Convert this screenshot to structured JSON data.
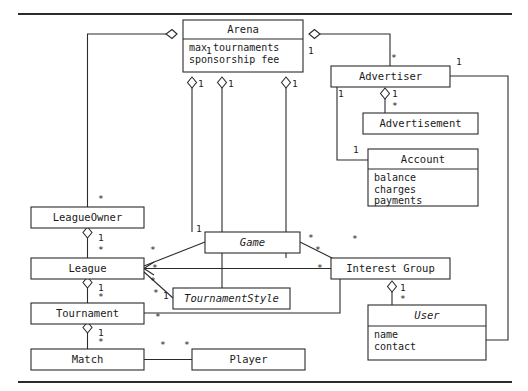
{
  "diagram": {
    "type": "uml-class-diagram",
    "frame": {
      "top_rule_y": 14,
      "bottom_rule_y": 382,
      "rule_color": "#2b2b2b"
    },
    "classes": [
      {
        "id": "arena",
        "name": "Arena",
        "abstract": false,
        "attributes": [
          "max tournaments",
          "sponsorship fee"
        ],
        "x": 183,
        "y": 20,
        "w": 120,
        "h": 52,
        "header_h": 19
      },
      {
        "id": "advertiser",
        "name": "Advertiser",
        "abstract": false,
        "attributes": [],
        "x": 331,
        "y": 66,
        "w": 119,
        "h": 21,
        "header_h": 21
      },
      {
        "id": "advertisement",
        "name": "Advertisement",
        "abstract": false,
        "attributes": [],
        "x": 363,
        "y": 113,
        "w": 115,
        "h": 21,
        "header_h": 21
      },
      {
        "id": "account",
        "name": "Account",
        "abstract": false,
        "attributes": [
          "balance",
          "charges",
          "payments"
        ],
        "x": 368,
        "y": 149,
        "w": 110,
        "h": 57,
        "header_h": 20
      },
      {
        "id": "leagueowner",
        "name": "LeagueOwner",
        "abstract": false,
        "attributes": [],
        "x": 31,
        "y": 207,
        "w": 113,
        "h": 21,
        "header_h": 21
      },
      {
        "id": "league",
        "name": "League",
        "abstract": false,
        "attributes": [],
        "x": 31,
        "y": 258,
        "w": 113,
        "h": 21,
        "header_h": 21
      },
      {
        "id": "tournament",
        "name": "Tournament",
        "abstract": false,
        "attributes": [],
        "x": 31,
        "y": 303,
        "w": 113,
        "h": 21,
        "header_h": 21
      },
      {
        "id": "match",
        "name": "Match",
        "abstract": false,
        "attributes": [],
        "x": 31,
        "y": 349,
        "w": 113,
        "h": 21,
        "header_h": 21
      },
      {
        "id": "player",
        "name": "Player",
        "abstract": false,
        "attributes": [],
        "x": 192,
        "y": 349,
        "w": 113,
        "h": 21,
        "header_h": 21
      },
      {
        "id": "game",
        "name": "Game",
        "abstract": true,
        "attributes": [],
        "x": 205,
        "y": 232,
        "w": 95,
        "h": 21,
        "header_h": 21
      },
      {
        "id": "tournamentstyle",
        "name": "TournamentStyle",
        "abstract": true,
        "attributes": [],
        "x": 173,
        "y": 288,
        "w": 117,
        "h": 21,
        "header_h": 21
      },
      {
        "id": "interestgroup",
        "name": "Interest Group",
        "abstract": false,
        "attributes": [],
        "x": 331,
        "y": 258,
        "w": 119,
        "h": 21,
        "header_h": 21
      },
      {
        "id": "user",
        "name": "User",
        "abstract": true,
        "attributes": [
          "name",
          "contact"
        ],
        "x": 368,
        "y": 305,
        "w": 118,
        "h": 55,
        "header_h": 21
      }
    ],
    "multiplicities": [
      {
        "label": "1",
        "x": 206,
        "y": 51
      },
      {
        "label": "1",
        "x": 308,
        "y": 51
      },
      {
        "label": "1",
        "x": 198,
        "y": 84
      },
      {
        "label": "1",
        "x": 228,
        "y": 84
      },
      {
        "label": "1",
        "x": 292,
        "y": 84
      },
      {
        "label": "*",
        "x": 391,
        "y": 58
      },
      {
        "label": "1",
        "x": 456,
        "y": 62
      },
      {
        "label": "1",
        "x": 338,
        "y": 94
      },
      {
        "label": "1",
        "x": 392,
        "y": 94
      },
      {
        "label": "*",
        "x": 392,
        "y": 106
      },
      {
        "label": "1",
        "x": 353,
        "y": 150
      },
      {
        "label": "*",
        "x": 98,
        "y": 199
      },
      {
        "label": "1",
        "x": 98,
        "y": 238
      },
      {
        "label": "*",
        "x": 98,
        "y": 250
      },
      {
        "label": "1",
        "x": 98,
        "y": 288
      },
      {
        "label": "*",
        "x": 98,
        "y": 297
      },
      {
        "label": "1",
        "x": 98,
        "y": 333
      },
      {
        "label": "*",
        "x": 98,
        "y": 342
      },
      {
        "label": "*",
        "x": 160,
        "y": 345
      },
      {
        "label": "*",
        "x": 184,
        "y": 345
      },
      {
        "label": "1",
        "x": 196,
        "y": 229
      },
      {
        "label": "*",
        "x": 150,
        "y": 250
      },
      {
        "label": "*",
        "x": 152,
        "y": 268
      },
      {
        "label": "*",
        "x": 150,
        "y": 281
      },
      {
        "label": "1",
        "x": 163,
        "y": 296
      },
      {
        "label": "*",
        "x": 153,
        "y": 293
      },
      {
        "label": "*",
        "x": 308,
        "y": 238
      },
      {
        "label": "*",
        "x": 315,
        "y": 250
      },
      {
        "label": "*",
        "x": 317,
        "y": 268
      },
      {
        "label": "*",
        "x": 352,
        "y": 239
      },
      {
        "label": "1",
        "x": 400,
        "y": 288
      },
      {
        "label": "*",
        "x": 400,
        "y": 299
      },
      {
        "label": "*",
        "x": 155,
        "y": 317
      }
    ],
    "relationships": [
      {
        "from": "arena",
        "to": "leagueowner",
        "kind": "aggregation",
        "from_mult": "1",
        "to_mult": "*"
      },
      {
        "from": "arena",
        "to": "game",
        "kind": "aggregation",
        "from_mult": "1",
        "to_mult": "*"
      },
      {
        "from": "arena",
        "to": "tournamentstyle",
        "kind": "aggregation",
        "from_mult": "1",
        "to_mult": "*"
      },
      {
        "from": "arena",
        "to": "interestgroup",
        "kind": "aggregation",
        "from_mult": "1",
        "to_mult": "*"
      },
      {
        "from": "arena",
        "to": "advertiser",
        "kind": "aggregation",
        "from_mult": "1",
        "to_mult": "*"
      },
      {
        "from": "advertiser",
        "to": "advertisement",
        "kind": "aggregation",
        "from_mult": "1",
        "to_mult": "*"
      },
      {
        "from": "advertiser",
        "to": "account",
        "kind": "association",
        "from_mult": "1",
        "to_mult": "1"
      },
      {
        "from": "advertiser",
        "to": "user",
        "kind": "generalization",
        "from_mult": "1",
        "to_mult": ""
      },
      {
        "from": "leagueowner",
        "to": "league",
        "kind": "aggregation",
        "from_mult": "1",
        "to_mult": "*"
      },
      {
        "from": "league",
        "to": "tournament",
        "kind": "aggregation",
        "from_mult": "1",
        "to_mult": "*"
      },
      {
        "from": "tournament",
        "to": "match",
        "kind": "aggregation",
        "from_mult": "1",
        "to_mult": "*"
      },
      {
        "from": "match",
        "to": "player",
        "kind": "association",
        "from_mult": "*",
        "to_mult": "*"
      },
      {
        "from": "game",
        "to": "league",
        "kind": "generalization",
        "from_mult": "1",
        "to_mult": "*"
      },
      {
        "from": "tournamentstyle",
        "to": "league",
        "kind": "generalization",
        "from_mult": "1",
        "to_mult": "*"
      },
      {
        "from": "interestgroup",
        "to": "league",
        "kind": "generalization",
        "from_mult": "*",
        "to_mult": "*"
      },
      {
        "from": "interestgroup",
        "to": "user",
        "kind": "aggregation",
        "from_mult": "1",
        "to_mult": "*"
      },
      {
        "from": "tournament",
        "to": "interestgroup",
        "kind": "association",
        "from_mult": "*",
        "to_mult": ""
      }
    ]
  }
}
